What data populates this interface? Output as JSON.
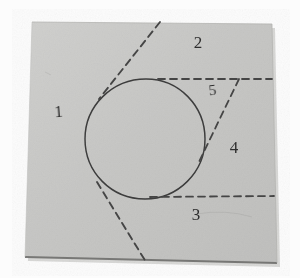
{
  "figure": {
    "medium": "photograph of paper sheet with pencil drawing",
    "background_color": "#fbfbfb",
    "paper_color": "#c9c9c7",
    "paper_shadow_color": "#8f8f8d",
    "ink_color": "#3a3a3a",
    "dash_color": "#4a4a4a"
  },
  "paper": {
    "corners": {
      "top_left": [
        32,
        22
      ],
      "top_right": [
        272,
        24
      ],
      "bottom_right": [
        277,
        263
      ],
      "bottom_left": [
        25,
        257
      ]
    }
  },
  "circle": {
    "center": [
      145,
      139
    ],
    "radius": 60,
    "stroke": "#3c3c3c",
    "stroke_width": 1.4,
    "fill": "none"
  },
  "lines": [
    {
      "id": "tangent-upper-left",
      "style": "dashed",
      "from": [
        160,
        22
      ],
      "to": [
        99,
        99
      ]
    },
    {
      "id": "tangent-lower-left",
      "style": "dashed",
      "from": [
        97,
        182
      ],
      "to": [
        146,
        262
      ]
    },
    {
      "id": "tangent-upper-horizontal",
      "style": "dashed",
      "from": [
        158,
        79
      ],
      "to": [
        272,
        79
      ]
    },
    {
      "id": "tangent-lower-horizontal",
      "style": "dashed",
      "from": [
        150,
        197
      ],
      "to": [
        274,
        196
      ]
    },
    {
      "id": "tangent-right-diagonal",
      "style": "dashed",
      "from": [
        239,
        79
      ],
      "to": [
        198,
        164
      ]
    }
  ],
  "labels": [
    {
      "text": "1",
      "x": 59,
      "y": 117,
      "rotation": -4,
      "size": 17
    },
    {
      "text": "2",
      "x": 198,
      "y": 48,
      "rotation": 0,
      "size": 17
    },
    {
      "text": "3",
      "x": 196,
      "y": 220,
      "rotation": 0,
      "size": 17
    },
    {
      "text": "4",
      "x": 234,
      "y": 153,
      "rotation": 0,
      "size": 17
    },
    {
      "text": "5",
      "x": 213,
      "y": 95,
      "rotation": -6,
      "size": 15
    }
  ],
  "region_count": 5
}
